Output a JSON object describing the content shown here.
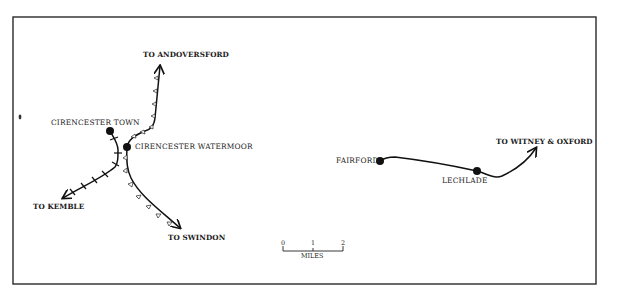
{
  "map": {
    "frame": {
      "x": 13,
      "y": 17,
      "width": 583,
      "height": 267,
      "stroke": "#2a2a2a"
    },
    "colors": {
      "line": "#111111",
      "marker_fill": "#ffffff"
    },
    "destinations": {
      "andoversford": "TO ANDOVERSFORD",
      "kemble": "TO KEMBLE",
      "swindon": "TO SWINDON",
      "witney_oxford": "TO WITNEY & OXFORD"
    },
    "stations": {
      "cirencester_town": "CIRENCESTER TOWN",
      "cirencester_watermoor": "CIRENCESTER WATERMOOR",
      "fairford": "FAIRFORD",
      "lechlade": "LECHLADE"
    },
    "scale_bar": {
      "ticks": [
        "0",
        "1",
        "2"
      ],
      "unit": "MILES"
    }
  }
}
